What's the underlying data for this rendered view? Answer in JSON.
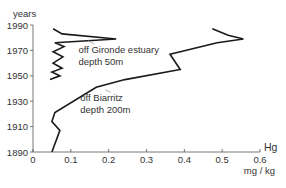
{
  "chart_data": {
    "type": "line",
    "title": "",
    "xlabel": "Hg",
    "xunit": "mg / kg",
    "ylabel": "years",
    "xlim": [
      0,
      0.6
    ],
    "ylim": [
      1890,
      1990
    ],
    "x_ticks": [
      0,
      0.1,
      0.2,
      0.3,
      0.4,
      0.5,
      0.6
    ],
    "x_tick_labels": [
      "0",
      "0.1",
      "0.2",
      "0.3",
      "0.4",
      "0.5",
      "0.6"
    ],
    "y_ticks": [
      1890,
      1910,
      1930,
      1950,
      1970,
      1990
    ],
    "y_tick_labels": [
      "1890",
      "1910",
      "1930",
      "1950",
      "1970",
      "1990"
    ],
    "grid": false,
    "series": [
      {
        "name": "off Gironde estuary depth 50m",
        "color": "#1a1a1a",
        "points": [
          [
            0.053,
            1987
          ],
          [
            0.077,
            1983
          ],
          [
            0.22,
            1979
          ],
          [
            0.058,
            1976
          ],
          [
            0.082,
            1973
          ],
          [
            0.053,
            1969
          ],
          [
            0.079,
            1965
          ],
          [
            0.053,
            1960
          ],
          [
            0.077,
            1956
          ],
          [
            0.05,
            1953
          ],
          [
            0.071,
            1950
          ],
          [
            0.045,
            1947
          ]
        ]
      },
      {
        "name": "off Biarritz depth 200m",
        "color": "#1a1a1a",
        "points": [
          [
            0.474,
            1987
          ],
          [
            0.516,
            1982
          ],
          [
            0.556,
            1979
          ],
          [
            0.487,
            1976
          ],
          [
            0.362,
            1967
          ],
          [
            0.389,
            1955
          ],
          [
            0.243,
            1947
          ],
          [
            0.167,
            1941
          ],
          [
            0.058,
            1921
          ],
          [
            0.05,
            1914
          ],
          [
            0.071,
            1907
          ],
          [
            0.05,
            1890
          ]
        ]
      }
    ],
    "annotations": [
      {
        "lines": [
          "off Gironde estuary",
          "depth 50m"
        ],
        "target_series": 0,
        "target_point": [
          0.145,
          1978
        ],
        "label_at": [
          0.12,
          1968
        ]
      },
      {
        "lines": [
          "off Biarritz",
          "depth 200m"
        ],
        "target_series": 1,
        "target_point": [
          0.19,
          1939
        ],
        "label_at": [
          0.125,
          1930
        ]
      }
    ]
  }
}
